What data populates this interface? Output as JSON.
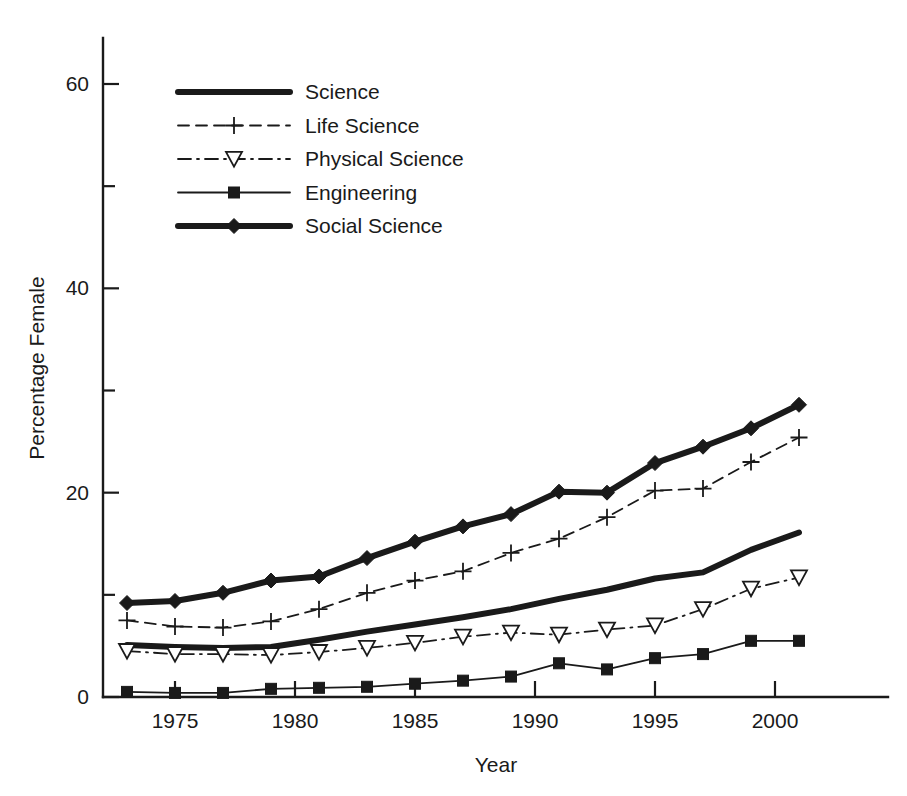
{
  "chart_data": {
    "type": "line",
    "title": "",
    "xlabel": "Year",
    "ylabel": "Percentage Female",
    "xlim": [
      1972,
      2002
    ],
    "ylim": [
      0,
      64
    ],
    "xticks": [
      1975,
      1980,
      1985,
      1990,
      1995,
      2000
    ],
    "xtick_labels": [
      "1975",
      "1980",
      "1985",
      "1990",
      "1995",
      "2000"
    ],
    "yticks": [
      0,
      20,
      40,
      60
    ],
    "ytick_labels": [
      "0",
      "20",
      "40",
      "60"
    ],
    "yminorticks": [
      10,
      30,
      50
    ],
    "grid": false,
    "legend_position": "upper-left",
    "x": [
      1973,
      1975,
      1977,
      1979,
      1981,
      1983,
      1985,
      1987,
      1989,
      1991,
      1993,
      1995,
      1997,
      1999,
      2001
    ],
    "series": [
      {
        "name": "Science",
        "style": "thick-solid",
        "marker": "none",
        "values": [
          5.1,
          4.9,
          4.8,
          4.9,
          5.6,
          6.4,
          7.1,
          7.8,
          8.6,
          9.6,
          10.5,
          11.6,
          12.2,
          14.4,
          16.1
        ]
      },
      {
        "name": "Life Science",
        "style": "dashed",
        "marker": "plus",
        "values": [
          7.5,
          6.9,
          6.8,
          7.4,
          8.6,
          10.2,
          11.4,
          12.3,
          14.1,
          15.5,
          17.6,
          20.2,
          20.4,
          23.0,
          25.4
        ]
      },
      {
        "name": "Physical Science",
        "style": "dash-dot",
        "marker": "down-triangle",
        "values": [
          4.5,
          4.2,
          4.2,
          4.1,
          4.4,
          4.8,
          5.3,
          5.9,
          6.3,
          6.1,
          6.6,
          7.0,
          8.6,
          10.6,
          11.7
        ]
      },
      {
        "name": "Engineering",
        "style": "thin-solid",
        "marker": "square",
        "values": [
          0.5,
          0.4,
          0.4,
          0.8,
          0.9,
          1.0,
          1.3,
          1.6,
          2.0,
          3.3,
          2.7,
          3.8,
          4.2,
          5.5,
          5.5
        ]
      },
      {
        "name": "Social Science",
        "style": "thick-solid",
        "marker": "diamond",
        "values": [
          9.2,
          9.4,
          10.2,
          11.4,
          11.8,
          13.6,
          15.2,
          16.7,
          17.9,
          20.1,
          20.0,
          22.9,
          24.5,
          26.3,
          28.6
        ]
      }
    ]
  },
  "legend": {
    "items": [
      {
        "label": "Science"
      },
      {
        "label": "Life Science"
      },
      {
        "label": "Physical Science"
      },
      {
        "label": "Engineering"
      },
      {
        "label": "Social Science"
      }
    ]
  }
}
